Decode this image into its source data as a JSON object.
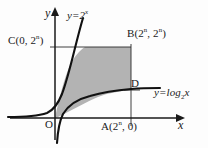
{
  "figure": {
    "background": "#fdfdfd",
    "ink_color": "#1a1a1a",
    "shade_color": "#b3b3b3"
  },
  "axes": {
    "y_label": "y",
    "x_label": "x",
    "origin_label": "O",
    "y_axis_x_px": 55,
    "x_axis_y_px": 118
  },
  "curves": [
    {
      "name": "exponential",
      "label_base": "y=2",
      "label_exponent": "x",
      "expression": "y = 2^x"
    },
    {
      "name": "logarithmic",
      "label_base": "y=log",
      "label_subscript": "2",
      "label_tail": "x",
      "expression": "y = log_2 x"
    }
  ],
  "points": [
    {
      "name": "C",
      "label_name": "C(0, 2",
      "label_exponent": "n",
      "label_tail": ")",
      "coords": "(0, 2^n)"
    },
    {
      "name": "B",
      "label_name": "B(2",
      "label_exponent": "n",
      "label_mid": ", 2",
      "label_exponent2": "n",
      "label_tail": ")",
      "coords": "(2^n, 2^n)"
    },
    {
      "name": "A",
      "label_name": "A(2",
      "label_exponent": "n",
      "label_tail": ", 0)",
      "coords": "(2^n, 0)"
    },
    {
      "name": "D",
      "label_name": "D",
      "coords": "(2^n, n)"
    }
  ]
}
